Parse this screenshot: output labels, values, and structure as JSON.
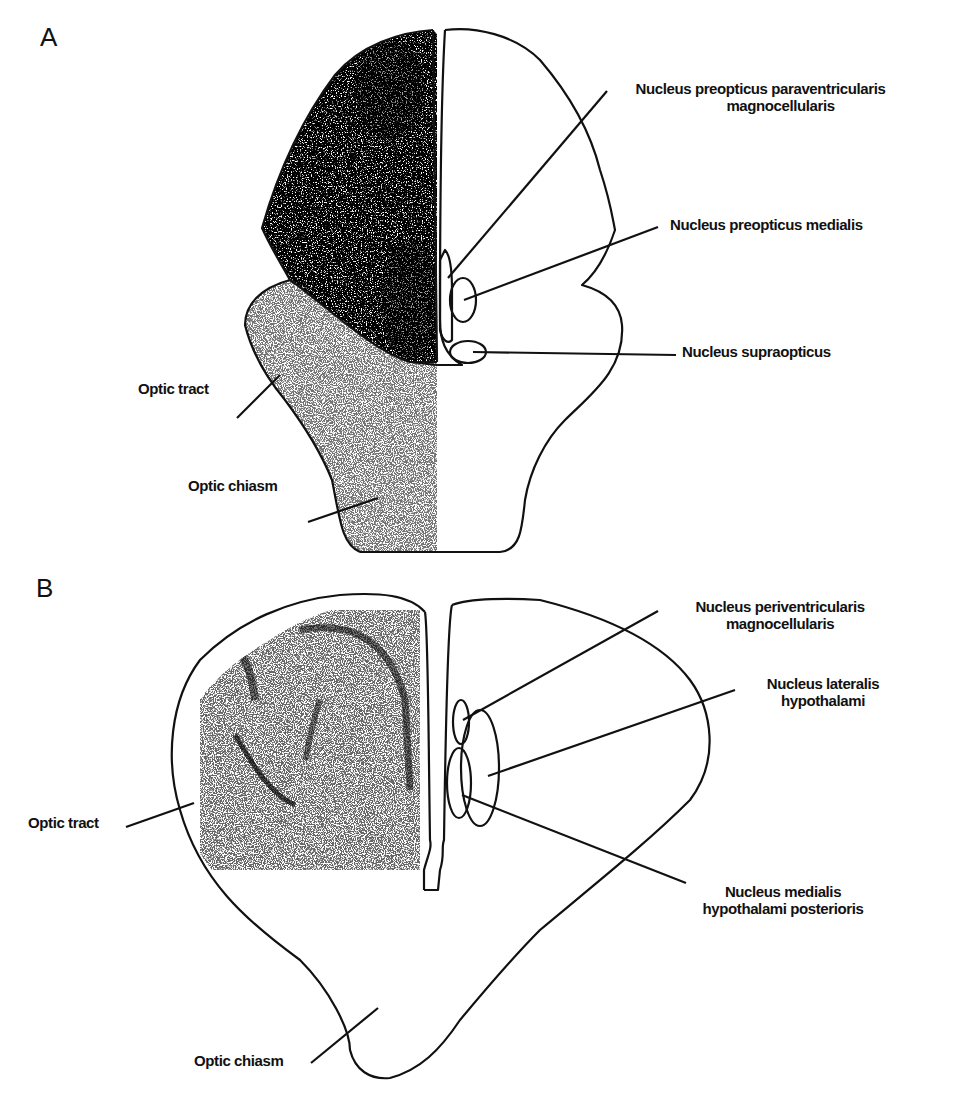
{
  "panels": [
    {
      "letter": "A",
      "labels": {
        "npp_line1": "Nucleus preopticus paraventricularis",
        "npp_line2": "magnocellularis",
        "npm": "Nucleus preopticus medialis",
        "nso": "Nucleus supraopticus",
        "optic_tract": "Optic tract",
        "optic_chiasm": "Optic chiasm"
      }
    },
    {
      "letter": "B",
      "labels": {
        "npv_line1": "Nucleus periventricularis",
        "npv_line2": "magnocellularis",
        "nlh_line1": "Nucleus lateralis",
        "nlh_line2": "hypothalami",
        "nmh_line1": "Nucleus medialis",
        "nmh_line2": "hypothalami posterioris",
        "optic_tract": "Optic tract",
        "optic_chiasm": "Optic chiasm"
      }
    }
  ],
  "colors": {
    "ink": "#111111",
    "background": "#ffffff"
  }
}
